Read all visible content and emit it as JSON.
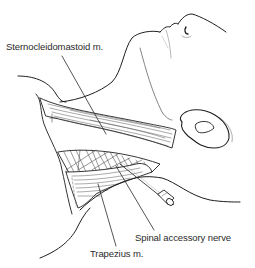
{
  "figure": {
    "type": "anatomical-line-illustration",
    "colors": {
      "background": "#ffffff",
      "line": "#1e1e1e",
      "hatch": "#555555",
      "label_text": "#2a2a2a"
    }
  },
  "labels": {
    "sternocleidomastoid": "Sternocleidomastoid m.",
    "spinal_accessory_nerve": "Spinal accessory nerve",
    "trapezius": "Trapezius m."
  }
}
